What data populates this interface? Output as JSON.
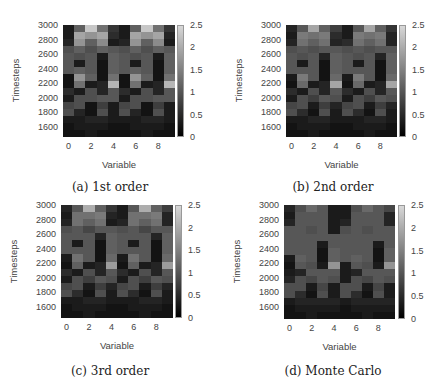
{
  "figure": {
    "colorbar": {
      "min": 0,
      "max": 2.5,
      "ticks": [
        "2.5",
        "2",
        "1.5",
        "1",
        "0.5",
        "0"
      ]
    },
    "yticks": [
      "3000",
      "2800",
      "2600",
      "2400",
      "2200",
      "2000",
      "1800",
      "1600"
    ],
    "xticks": [
      "0",
      "2",
      "4",
      "6",
      "8"
    ],
    "xlabel": "Variable",
    "ylabel": "Timesteps",
    "panels": [
      {
        "id": "a",
        "caption": "(a) 1st order"
      },
      {
        "id": "b",
        "caption": "(b) 2nd order"
      },
      {
        "id": "c",
        "caption": "(c) 3rd order"
      },
      {
        "id": "d",
        "caption": "(d) Monte Carlo"
      }
    ]
  },
  "chart_data": [
    {
      "type": "heatmap",
      "title": "(a) 1st order",
      "xlabel": "Variable",
      "ylabel": "Timesteps",
      "x": [
        0,
        1,
        2,
        3,
        4,
        5,
        6,
        7,
        8,
        9
      ],
      "y": [
        3000,
        2900,
        2800,
        2700,
        2600,
        2500,
        2400,
        2300,
        2200,
        2100,
        2000,
        1900,
        1800,
        1700,
        1600,
        1500
      ],
      "xticks": [
        0,
        2,
        4,
        6,
        8
      ],
      "yticks": [
        1600,
        1800,
        2000,
        2200,
        2400,
        2600,
        2800,
        3000
      ],
      "colorbar": {
        "range": [
          0,
          2.5
        ],
        "ticks": [
          0,
          0.5,
          1,
          1.5,
          2,
          2.5
        ],
        "colormap": "gray"
      },
      "values": [
        [
          0.2,
          1.0,
          2.2,
          1.2,
          0.5,
          0.2,
          1.0,
          2.2,
          1.2,
          0.5
        ],
        [
          0.2,
          1.8,
          1.6,
          1.8,
          0.4,
          0.2,
          1.8,
          1.6,
          1.8,
          0.3
        ],
        [
          0.3,
          1.6,
          1.0,
          1.5,
          0.2,
          0.3,
          1.6,
          1.0,
          1.5,
          0.2
        ],
        [
          0.8,
          1.0,
          0.8,
          1.0,
          0.9,
          0.8,
          1.0,
          0.8,
          1.0,
          0.9
        ],
        [
          0.9,
          0.8,
          0.9,
          0.2,
          1.0,
          0.9,
          0.8,
          0.9,
          0.2,
          1.0
        ],
        [
          0.9,
          0.2,
          0.9,
          0.1,
          1.0,
          0.9,
          0.2,
          0.9,
          0.1,
          1.0
        ],
        [
          0.9,
          1.0,
          0.9,
          0.1,
          1.0,
          0.9,
          1.0,
          0.9,
          0.1,
          1.0
        ],
        [
          0.1,
          1.6,
          1.0,
          0.1,
          1.2,
          0.1,
          1.6,
          1.0,
          0.1,
          1.2
        ],
        [
          0.1,
          1.2,
          0.2,
          0.3,
          2.0,
          0.1,
          1.2,
          0.2,
          0.3,
          2.0
        ],
        [
          0.4,
          0.2,
          0.8,
          0.3,
          0.9,
          0.4,
          0.2,
          0.8,
          0.3,
          0.9
        ],
        [
          0.2,
          0.8,
          0.8,
          0.9,
          0.9,
          0.2,
          0.8,
          0.8,
          0.9,
          0.9
        ],
        [
          0.7,
          0.8,
          0.1,
          0.6,
          0.2,
          0.7,
          0.8,
          0.1,
          0.6,
          0.2
        ],
        [
          0.8,
          0.3,
          0.1,
          0.8,
          0.2,
          0.8,
          0.3,
          0.1,
          0.8,
          0.2
        ],
        [
          0.2,
          0.2,
          0.3,
          0.3,
          0.2,
          0.2,
          0.2,
          0.3,
          0.3,
          0.2
        ],
        [
          0.1,
          0.2,
          0.2,
          0.2,
          0.1,
          0.1,
          0.2,
          0.2,
          0.2,
          0.1
        ],
        [
          0.1,
          0.1,
          0.2,
          0.1,
          0.1,
          0.1,
          0.1,
          0.2,
          0.1,
          0.1
        ]
      ]
    },
    {
      "type": "heatmap",
      "title": "(b) 2nd order",
      "xlabel": "Variable",
      "ylabel": "Timesteps",
      "x": [
        0,
        1,
        2,
        3,
        4,
        5,
        6,
        7,
        8,
        9
      ],
      "y": [
        3000,
        2900,
        2800,
        2700,
        2600,
        2500,
        2400,
        2300,
        2200,
        2100,
        2000,
        1900,
        1800,
        1700,
        1600,
        1500
      ],
      "xticks": [
        0,
        2,
        4,
        6,
        8
      ],
      "yticks": [
        1600,
        1800,
        2000,
        2200,
        2400,
        2600,
        2800,
        3000
      ],
      "colorbar": {
        "range": [
          0,
          2.5
        ],
        "ticks": [
          0,
          0.5,
          1,
          1.5,
          2,
          2.5
        ],
        "colormap": "gray"
      },
      "values": [
        [
          0.3,
          0.9,
          1.8,
          1.0,
          0.6,
          0.2,
          0.9,
          1.8,
          1.0,
          0.5
        ],
        [
          0.2,
          1.3,
          1.2,
          1.3,
          0.4,
          0.2,
          1.3,
          1.2,
          1.3,
          0.3
        ],
        [
          0.3,
          1.2,
          1.0,
          1.2,
          0.3,
          0.4,
          1.2,
          1.0,
          1.2,
          0.3
        ],
        [
          0.8,
          0.9,
          0.8,
          0.9,
          0.9,
          0.8,
          0.9,
          0.8,
          0.9,
          0.9
        ],
        [
          0.9,
          0.8,
          0.9,
          0.3,
          1.0,
          0.9,
          0.8,
          0.9,
          0.3,
          1.0
        ],
        [
          0.9,
          0.2,
          0.9,
          0.1,
          1.0,
          0.9,
          0.2,
          0.9,
          0.1,
          1.0
        ],
        [
          0.9,
          0.9,
          0.9,
          0.1,
          1.0,
          0.9,
          0.9,
          0.9,
          0.1,
          1.0
        ],
        [
          0.2,
          1.3,
          0.9,
          0.1,
          1.1,
          0.2,
          1.3,
          0.9,
          0.1,
          1.1
        ],
        [
          0.1,
          1.1,
          0.2,
          0.3,
          1.8,
          0.1,
          1.1,
          0.2,
          0.3,
          1.8
        ],
        [
          0.4,
          0.2,
          0.8,
          0.3,
          0.9,
          0.4,
          0.2,
          0.8,
          0.3,
          0.9
        ],
        [
          0.2,
          0.8,
          0.6,
          0.9,
          0.8,
          0.2,
          0.8,
          0.6,
          0.9,
          0.8
        ],
        [
          0.7,
          0.8,
          0.2,
          0.6,
          0.3,
          0.7,
          0.8,
          0.2,
          0.6,
          0.3
        ],
        [
          0.8,
          0.4,
          0.1,
          0.8,
          0.2,
          0.8,
          0.4,
          0.1,
          0.8,
          0.2
        ],
        [
          0.2,
          0.2,
          0.3,
          0.3,
          0.2,
          0.2,
          0.2,
          0.3,
          0.3,
          0.2
        ],
        [
          0.1,
          0.2,
          0.2,
          0.2,
          0.1,
          0.1,
          0.2,
          0.2,
          0.2,
          0.1
        ],
        [
          0.1,
          0.1,
          0.2,
          0.1,
          0.1,
          0.1,
          0.1,
          0.2,
          0.1,
          0.1
        ]
      ]
    },
    {
      "type": "heatmap",
      "title": "(c) 3rd order",
      "xlabel": "Variable",
      "ylabel": "Timesteps",
      "x": [
        0,
        1,
        2,
        3,
        4,
        5,
        6,
        7,
        8,
        9
      ],
      "y": [
        3000,
        2900,
        2800,
        2700,
        2600,
        2500,
        2400,
        2300,
        2200,
        2100,
        2000,
        1900,
        1800,
        1700,
        1600,
        1500
      ],
      "xticks": [
        0,
        2,
        4,
        6,
        8
      ],
      "yticks": [
        1600,
        1800,
        2000,
        2200,
        2400,
        2600,
        2800,
        3000
      ],
      "colorbar": {
        "range": [
          0,
          2.5
        ],
        "ticks": [
          0,
          0.5,
          1,
          1.5,
          2,
          2.5
        ],
        "colormap": "gray"
      },
      "values": [
        [
          0.3,
          0.9,
          1.9,
          1.0,
          0.5,
          0.2,
          0.9,
          1.9,
          1.0,
          0.6
        ],
        [
          0.2,
          1.2,
          1.2,
          1.3,
          0.3,
          0.2,
          1.2,
          1.2,
          1.3,
          0.3
        ],
        [
          0.3,
          1.2,
          1.0,
          1.2,
          0.2,
          0.3,
          1.2,
          1.0,
          1.2,
          0.3
        ],
        [
          0.8,
          0.9,
          0.7,
          0.9,
          0.9,
          0.8,
          0.9,
          0.7,
          0.9,
          0.9
        ],
        [
          0.9,
          0.9,
          0.9,
          0.3,
          1.0,
          0.9,
          0.9,
          0.9,
          0.3,
          1.0
        ],
        [
          0.9,
          0.2,
          0.9,
          0.1,
          1.0,
          0.9,
          0.2,
          0.9,
          0.1,
          1.0
        ],
        [
          0.9,
          0.9,
          0.9,
          0.1,
          1.0,
          0.9,
          0.9,
          0.9,
          0.1,
          1.0
        ],
        [
          0.2,
          1.2,
          0.9,
          0.1,
          1.1,
          0.2,
          1.2,
          0.9,
          0.1,
          1.1
        ],
        [
          0.1,
          1.0,
          0.2,
          0.3,
          1.7,
          0.1,
          1.0,
          0.2,
          0.3,
          1.7
        ],
        [
          0.4,
          0.2,
          0.8,
          0.3,
          0.9,
          0.4,
          0.2,
          0.8,
          0.3,
          0.9
        ],
        [
          0.2,
          0.8,
          0.6,
          0.9,
          0.8,
          0.2,
          0.8,
          0.6,
          0.9,
          0.8
        ],
        [
          0.7,
          0.8,
          0.2,
          0.6,
          0.3,
          0.7,
          0.8,
          0.2,
          0.6,
          0.3
        ],
        [
          0.8,
          0.4,
          0.1,
          0.8,
          0.2,
          0.8,
          0.4,
          0.1,
          0.8,
          0.2
        ],
        [
          0.2,
          0.2,
          0.3,
          0.3,
          0.2,
          0.2,
          0.2,
          0.3,
          0.3,
          0.2
        ],
        [
          0.1,
          0.2,
          0.2,
          0.2,
          0.1,
          0.1,
          0.2,
          0.2,
          0.2,
          0.1
        ],
        [
          0.1,
          0.1,
          0.2,
          0.1,
          0.1,
          0.1,
          0.1,
          0.2,
          0.1,
          0.1
        ]
      ]
    },
    {
      "type": "heatmap",
      "title": "(d) Monte Carlo",
      "xlabel": "Variable",
      "ylabel": "Timesteps",
      "x": [
        0,
        1,
        2,
        3,
        4,
        5,
        6,
        7,
        8,
        9
      ],
      "y": [
        3000,
        2900,
        2800,
        2700,
        2600,
        2500,
        2400,
        2300,
        2200,
        2100,
        2000,
        1900,
        1800,
        1700,
        1600,
        1500
      ],
      "xticks": [
        0,
        2,
        4,
        6,
        8
      ],
      "yticks": [
        1600,
        1800,
        2000,
        2200,
        2400,
        2600,
        2800,
        3000
      ],
      "colorbar": {
        "range": [
          0,
          2.5
        ],
        "ticks": [
          0,
          0.5,
          1,
          1.5,
          2,
          2.5
        ],
        "colormap": "gray"
      },
      "values": [
        [
          0.3,
          0.8,
          1.1,
          0.9,
          0.2,
          0.2,
          0.8,
          1.1,
          0.9,
          0.7
        ],
        [
          0.2,
          0.9,
          0.9,
          0.9,
          0.2,
          0.2,
          0.9,
          0.9,
          0.9,
          0.3
        ],
        [
          0.3,
          0.9,
          0.9,
          0.9,
          0.2,
          0.3,
          0.9,
          0.9,
          0.9,
          0.3
        ],
        [
          0.9,
          0.9,
          0.8,
          0.9,
          0.2,
          0.8,
          0.9,
          0.8,
          0.9,
          0.9
        ],
        [
          0.9,
          0.9,
          0.9,
          0.9,
          0.9,
          0.9,
          0.9,
          0.9,
          0.9,
          0.9
        ],
        [
          0.9,
          0.9,
          0.9,
          0.2,
          0.9,
          0.9,
          0.9,
          0.9,
          0.2,
          0.9
        ],
        [
          0.9,
          0.9,
          0.9,
          0.1,
          1.0,
          0.9,
          0.9,
          0.9,
          0.1,
          1.0
        ],
        [
          0.2,
          1.0,
          0.9,
          0.1,
          1.0,
          0.9,
          1.0,
          0.9,
          0.1,
          1.0
        ],
        [
          0.1,
          0.9,
          0.8,
          0.2,
          1.6,
          0.2,
          0.9,
          0.8,
          0.2,
          1.6
        ],
        [
          0.2,
          0.3,
          0.9,
          0.9,
          0.9,
          0.2,
          0.3,
          0.9,
          0.9,
          0.9
        ],
        [
          0.3,
          0.8,
          0.7,
          0.9,
          0.8,
          0.2,
          0.8,
          0.7,
          0.9,
          0.8
        ],
        [
          0.8,
          0.8,
          0.2,
          0.7,
          0.2,
          0.8,
          0.8,
          0.2,
          0.7,
          0.2
        ],
        [
          0.8,
          0.4,
          0.1,
          0.8,
          0.2,
          0.8,
          0.4,
          0.1,
          0.8,
          0.2
        ],
        [
          0.2,
          0.3,
          0.3,
          0.3,
          0.3,
          0.2,
          0.3,
          0.3,
          0.3,
          0.3
        ],
        [
          0.1,
          0.2,
          0.2,
          0.2,
          0.2,
          0.1,
          0.2,
          0.2,
          0.2,
          0.2
        ],
        [
          0.1,
          0.1,
          0.2,
          0.1,
          0.1,
          0.1,
          0.1,
          0.2,
          0.1,
          0.1
        ]
      ]
    }
  ]
}
